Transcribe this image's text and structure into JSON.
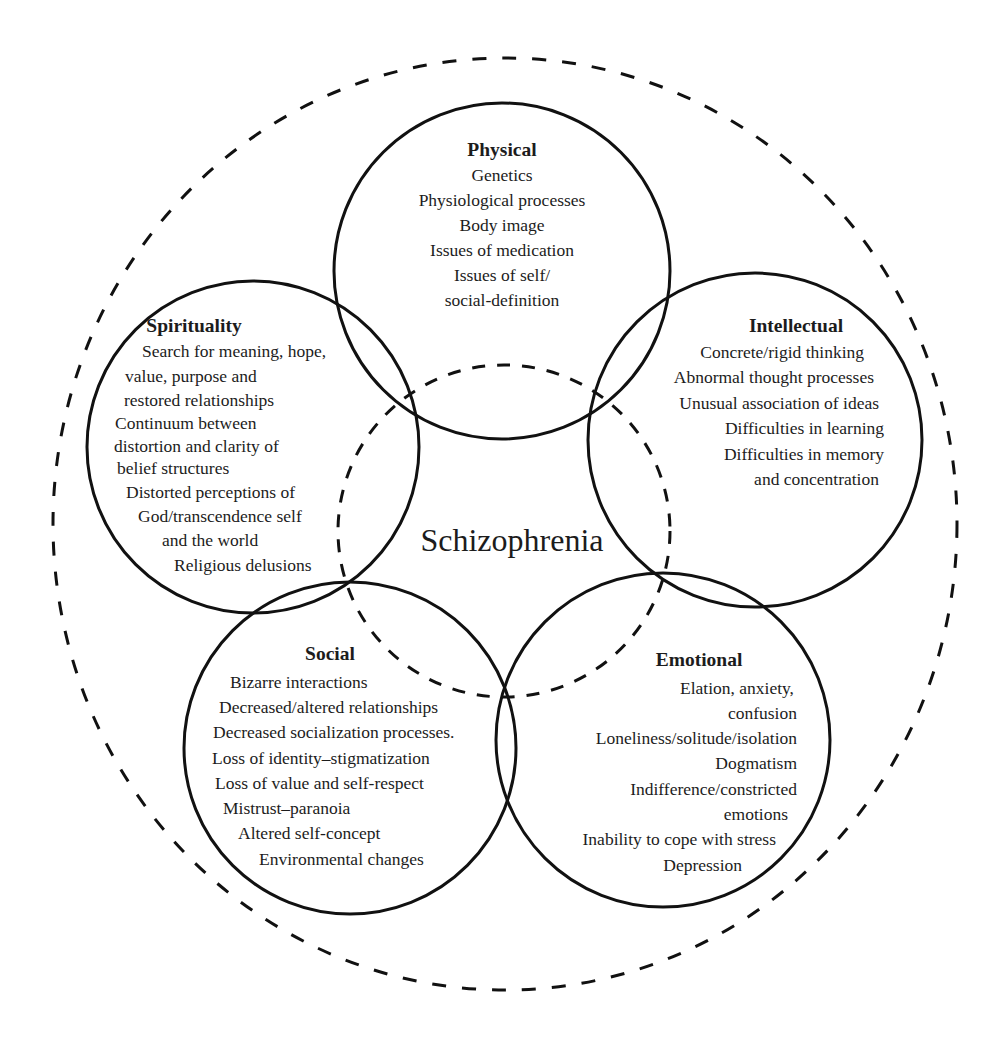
{
  "diagram": {
    "center_label": "Schizophrenia",
    "colors": {
      "stroke": "#111111",
      "text": "#1c1c1c",
      "background": "#ffffff"
    },
    "domains": {
      "physical": {
        "title": "Physical",
        "items": [
          "Genetics",
          "Physiological processes",
          "Body image",
          "Issues of medication",
          "Issues of self/",
          "social-definition"
        ]
      },
      "spirituality": {
        "title": "Spirituality",
        "items": [
          "Search for meaning, hope,",
          "value, purpose and",
          "restored relationships",
          "Continuum between",
          "distortion and clarity of",
          "belief structures",
          "Distorted perceptions of",
          "God/transcendence self",
          "and the world",
          "Religious delusions"
        ]
      },
      "intellectual": {
        "title": "Intellectual",
        "items": [
          "Concrete/rigid thinking",
          "Abnormal thought processes",
          "Unusual association of ideas",
          "Difficulties in learning",
          "Difficulties in memory",
          "and concentration"
        ]
      },
      "social": {
        "title": "Social",
        "items": [
          "Bizarre interactions",
          "Decreased/altered relationships",
          "Decreased socialization processes.",
          "Loss of identity–stigmatization",
          "Loss of value and self-respect",
          "Mistrust–paranoia",
          "Altered self-concept",
          "Environmental changes"
        ]
      },
      "emotional": {
        "title": "Emotional",
        "items": [
          "Elation, anxiety,",
          "confusion",
          "Loneliness/solitude/isolation",
          "Dogmatism",
          "Indifference/constricted",
          "emotions",
          "Inability to cope with stress",
          "Depression"
        ]
      }
    }
  }
}
